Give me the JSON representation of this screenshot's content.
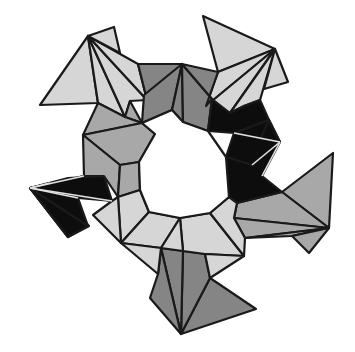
{
  "figure": {
    "width": 355,
    "height": 352,
    "center": [
      182,
      172
    ],
    "symmetry": 5,
    "colors": {
      "background": "#ffffff",
      "light": "#d6d6d6",
      "medium": "#a8a8a8",
      "dark_gray": "#858585",
      "black": "#0d0d0d",
      "edge": "#1a1a1a",
      "inner_edge_on_black": "#e0e0e0"
    },
    "polygons": [
      {
        "name": "top-left-fan-big",
        "fill": "light",
        "points": [
          [
            40,
            105
          ],
          [
            88,
            36
          ],
          [
            98,
            103
          ]
        ]
      },
      {
        "name": "top-left-fan-1",
        "fill": "light",
        "points": [
          [
            88,
            36
          ],
          [
            98,
            103
          ],
          [
            125,
            117
          ]
        ]
      },
      {
        "name": "top-left-fan-2",
        "fill": "light",
        "points": [
          [
            88,
            36
          ],
          [
            125,
            117
          ],
          [
            130,
            101
          ],
          [
            147,
            100
          ]
        ]
      },
      {
        "name": "top-left-fan-3",
        "fill": "light",
        "points": [
          [
            88,
            36
          ],
          [
            147,
            100
          ],
          [
            138,
            64
          ]
        ]
      },
      {
        "name": "top-left-fan-tip",
        "fill": "light",
        "points": [
          [
            88,
            36
          ],
          [
            114,
            27
          ],
          [
            120,
            53
          ]
        ]
      },
      {
        "name": "top-right-fan-big",
        "fill": "light",
        "points": [
          [
            203,
            16
          ],
          [
            275,
            49
          ],
          [
            218,
            72
          ]
        ]
      },
      {
        "name": "top-right-fan-1",
        "fill": "light",
        "points": [
          [
            218,
            72
          ],
          [
            275,
            49
          ],
          [
            206,
            106
          ]
        ]
      },
      {
        "name": "top-right-fan-2",
        "fill": "light",
        "points": [
          [
            275,
            49
          ],
          [
            206,
            106
          ],
          [
            230,
            113
          ]
        ]
      },
      {
        "name": "top-right-fan-3",
        "fill": "light",
        "points": [
          [
            275,
            49
          ],
          [
            230,
            113
          ],
          [
            244,
            106
          ],
          [
            260,
            100
          ]
        ]
      },
      {
        "name": "top-right-fan-tip",
        "fill": "light",
        "points": [
          [
            275,
            49
          ],
          [
            288,
            82
          ],
          [
            264,
            89
          ]
        ]
      },
      {
        "name": "right-fan-big",
        "fill": "medium",
        "points": [
          [
            333,
            153
          ],
          [
            329,
            228
          ],
          [
            282,
            192
          ]
        ]
      },
      {
        "name": "right-fan-1",
        "fill": "medium",
        "points": [
          [
            282,
            192
          ],
          [
            329,
            228
          ],
          [
            234,
            218
          ],
          [
            237,
            203
          ]
        ]
      },
      {
        "name": "right-fan-2",
        "fill": "medium",
        "points": [
          [
            329,
            228
          ],
          [
            234,
            218
          ],
          [
            245,
            238
          ]
        ]
      },
      {
        "name": "right-fan-3",
        "fill": "medium",
        "points": [
          [
            329,
            228
          ],
          [
            245,
            238
          ],
          [
            292,
            236
          ]
        ]
      },
      {
        "name": "right-fan-tip",
        "fill": "medium",
        "points": [
          [
            329,
            228
          ],
          [
            292,
            236
          ],
          [
            309,
            253
          ]
        ]
      },
      {
        "name": "bottom-fan-big",
        "fill": "dark_gray",
        "points": [
          [
            210,
            278
          ],
          [
            256,
            309
          ],
          [
            181,
            334
          ]
        ]
      },
      {
        "name": "bottom-fan-1",
        "fill": "dark_gray",
        "points": [
          [
            181,
            334
          ],
          [
            210,
            278
          ],
          [
            205,
            254
          ],
          [
            183,
            251
          ]
        ]
      },
      {
        "name": "bottom-fan-2",
        "fill": "dark_gray",
        "points": [
          [
            181,
            334
          ],
          [
            183,
            251
          ],
          [
            161,
            248
          ]
        ]
      },
      {
        "name": "bottom-fan-3",
        "fill": "dark_gray",
        "points": [
          [
            181,
            334
          ],
          [
            161,
            248
          ],
          [
            158,
            274
          ],
          [
            150,
            298
          ]
        ]
      },
      {
        "name": "left-fan-big",
        "fill": "black",
        "points": [
          [
            30,
            188
          ],
          [
            68,
            237
          ],
          [
            89,
            226
          ],
          [
            50,
            184
          ]
        ]
      },
      {
        "name": "left-fan-0",
        "fill": "black",
        "points": [
          [
            30,
            188
          ],
          [
            50,
            183
          ],
          [
            68,
            237
          ]
        ]
      },
      {
        "name": "left-fan-1",
        "fill": "black",
        "points": [
          [
            30,
            188
          ],
          [
            88,
            226
          ],
          [
            68,
            237
          ]
        ]
      },
      {
        "name": "left-fan-2",
        "fill": "black",
        "points": [
          [
            30,
            188
          ],
          [
            88,
            226
          ],
          [
            78,
            198
          ]
        ]
      },
      {
        "name": "left-fan-3",
        "fill": "black",
        "points": [
          [
            30,
            188
          ],
          [
            78,
            198
          ],
          [
            112,
            201
          ]
        ]
      },
      {
        "name": "left-fan-4",
        "fill": "black",
        "points": [
          [
            30,
            188
          ],
          [
            112,
            201
          ],
          [
            104,
            176
          ],
          [
            84,
            176
          ]
        ]
      },
      {
        "name": "left-fan-5",
        "fill": "black",
        "points": [
          [
            30,
            188
          ],
          [
            84,
            176
          ],
          [
            104,
            176
          ],
          [
            68,
            178
          ]
        ]
      },
      {
        "name": "ring-top-left",
        "fill": "dark_gray",
        "points": [
          [
            138,
            64
          ],
          [
            182,
            64
          ],
          [
            172,
            110
          ],
          [
            147,
            100
          ]
        ]
      },
      {
        "name": "ring-top-center-a",
        "fill": "dark_gray",
        "points": [
          [
            182,
            64
          ],
          [
            172,
            110
          ],
          [
            142,
            123
          ],
          [
            144,
            95
          ]
        ]
      },
      {
        "name": "ring-top-center-b",
        "fill": "dark_gray",
        "points": [
          [
            182,
            64
          ],
          [
            183,
            122
          ],
          [
            172,
            110
          ]
        ]
      },
      {
        "name": "ring-top-right-a",
        "fill": "dark_gray",
        "points": [
          [
            182,
            64
          ],
          [
            183,
            122
          ],
          [
            208,
            131
          ],
          [
            212,
            99
          ]
        ]
      },
      {
        "name": "ring-top-right-b",
        "fill": "dark_gray",
        "points": [
          [
            182,
            64
          ],
          [
            218,
            72
          ],
          [
            206,
            106
          ],
          [
            212,
            99
          ]
        ]
      },
      {
        "name": "ring-right-black-1",
        "fill": "black",
        "points": [
          [
            208,
            131
          ],
          [
            212,
            99
          ],
          [
            230,
            113
          ],
          [
            244,
            106
          ],
          [
            260,
            100
          ],
          [
            269,
            120
          ],
          [
            234,
            133
          ]
        ]
      },
      {
        "name": "ring-right-black-2",
        "fill": "black",
        "points": [
          [
            234,
            133
          ],
          [
            269,
            120
          ],
          [
            280,
            142
          ]
        ]
      },
      {
        "name": "ring-right-black-3",
        "fill": "black",
        "points": [
          [
            269,
            120
          ],
          [
            280,
            142
          ],
          [
            258,
            152
          ],
          [
            250,
            162
          ]
        ]
      },
      {
        "name": "ring-right-black-4",
        "fill": "black",
        "points": [
          [
            234,
            133
          ],
          [
            280,
            142
          ],
          [
            252,
            165
          ],
          [
            226,
            157
          ]
        ]
      },
      {
        "name": "ring-right-black-5",
        "fill": "black",
        "points": [
          [
            252,
            165
          ],
          [
            280,
            142
          ],
          [
            262,
            176
          ],
          [
            282,
            192
          ],
          [
            237,
            203
          ],
          [
            229,
            197
          ],
          [
            226,
            157
          ]
        ]
      },
      {
        "name": "ring-left-a",
        "fill": "medium",
        "points": [
          [
            125,
            117
          ],
          [
            142,
            123
          ],
          [
            130,
            101
          ]
        ]
      },
      {
        "name": "ring-left-b",
        "fill": "medium",
        "points": [
          [
            98,
            103
          ],
          [
            125,
            117
          ],
          [
            142,
            123
          ],
          [
            83,
            135
          ]
        ]
      },
      {
        "name": "ring-left-c",
        "fill": "medium",
        "points": [
          [
            83,
            135
          ],
          [
            142,
            123
          ],
          [
            155,
            134
          ],
          [
            139,
            162
          ],
          [
            120,
            165
          ]
        ]
      },
      {
        "name": "ring-left-d",
        "fill": "medium",
        "points": [
          [
            83,
            135
          ],
          [
            120,
            165
          ],
          [
            118,
            197
          ],
          [
            104,
            176
          ],
          [
            84,
            176
          ]
        ]
      },
      {
        "name": "ring-left-e",
        "fill": "medium",
        "points": [
          [
            120,
            165
          ],
          [
            139,
            162
          ],
          [
            140,
            190
          ],
          [
            118,
            197
          ]
        ]
      },
      {
        "name": "ring-bottom-left-a",
        "fill": "light",
        "points": [
          [
            118,
            197
          ],
          [
            140,
            190
          ],
          [
            149,
            212
          ],
          [
            121,
            243
          ]
        ]
      },
      {
        "name": "ring-bottom-left-b",
        "fill": "light",
        "points": [
          [
            112,
            201
          ],
          [
            118,
            197
          ],
          [
            121,
            243
          ],
          [
            93,
            215
          ]
        ]
      },
      {
        "name": "ring-bottom-left-c",
        "fill": "light",
        "points": [
          [
            121,
            243
          ],
          [
            149,
            212
          ],
          [
            180,
            218
          ],
          [
            161,
            248
          ]
        ]
      },
      {
        "name": "ring-bottom-left-d",
        "fill": "light",
        "points": [
          [
            121,
            243
          ],
          [
            161,
            248
          ],
          [
            158,
            274
          ]
        ]
      },
      {
        "name": "ring-bottom-right-a",
        "fill": "light",
        "points": [
          [
            180,
            218
          ],
          [
            210,
            213
          ],
          [
            244,
            256
          ],
          [
            205,
            254
          ],
          [
            183,
            251
          ]
        ]
      },
      {
        "name": "ring-bottom-right-b",
        "fill": "light",
        "points": [
          [
            210,
            213
          ],
          [
            229,
            197
          ],
          [
            237,
            203
          ],
          [
            234,
            218
          ],
          [
            245,
            238
          ],
          [
            244,
            256
          ]
        ]
      },
      {
        "name": "ring-bottom-right-c",
        "fill": "light",
        "points": [
          [
            205,
            254
          ],
          [
            244,
            256
          ],
          [
            210,
            278
          ]
        ]
      },
      {
        "name": "ring-bottom-center",
        "fill": "light",
        "points": [
          [
            180,
            218
          ],
          [
            183,
            251
          ],
          [
            161,
            248
          ]
        ]
      }
    ],
    "inner_hole": {
      "name": "decagon-hole",
      "points": [
        [
          172,
          110
        ],
        [
          183,
          122
        ],
        [
          208,
          131
        ],
        [
          226,
          157
        ],
        [
          229,
          197
        ],
        [
          210,
          213
        ],
        [
          180,
          218
        ],
        [
          149,
          212
        ],
        [
          140,
          190
        ],
        [
          139,
          162
        ],
        [
          155,
          134
        ],
        [
          142,
          123
        ]
      ]
    },
    "white_edges_on_black": [
      [
        [
          30,
          188
        ],
        [
          50,
          183
        ]
      ],
      [
        [
          30,
          188
        ],
        [
          78,
          198
        ]
      ],
      [
        [
          30,
          188
        ],
        [
          84,
          176
        ]
      ],
      [
        [
          30,
          188
        ],
        [
          112,
          201
        ]
      ],
      [
        [
          280,
          142
        ],
        [
          234,
          133
        ]
      ],
      [
        [
          280,
          142
        ],
        [
          252,
          165
        ]
      ],
      [
        [
          280,
          142
        ],
        [
          262,
          176
        ]
      ]
    ]
  }
}
